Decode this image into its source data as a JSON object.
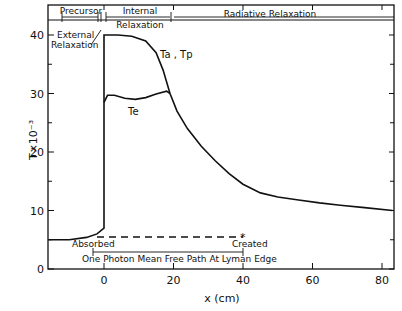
{
  "chart_data": {
    "type": "line",
    "title": "",
    "xlabel": "x (cm)",
    "ylabel": "T×10⁻³",
    "xlim": [
      -16,
      84
    ],
    "ylim": [
      0,
      44
    ],
    "x_ticks": [
      "0",
      "20",
      "40",
      "60",
      "80"
    ],
    "y_ticks": [
      "0",
      "10",
      "20",
      "30",
      "40"
    ],
    "grid": false,
    "series": [
      {
        "name": "Ta, Tp",
        "x": [
          -16,
          -10,
          -5,
          -2,
          0,
          0,
          4,
          8,
          12,
          15,
          17,
          19,
          21,
          24,
          28,
          32,
          36,
          40,
          45,
          50,
          56,
          62,
          68,
          75,
          83
        ],
        "values": [
          5,
          5,
          5.4,
          6,
          7,
          40,
          40,
          39.8,
          39,
          37,
          34,
          30,
          27,
          24,
          21,
          18.5,
          16.3,
          14.5,
          13,
          12.3,
          11.8,
          11.3,
          10.9,
          10.5,
          10
        ]
      },
      {
        "name": "Te",
        "x": [
          0,
          1,
          3,
          6,
          9,
          12,
          15,
          18,
          19
        ],
        "values": [
          28.5,
          29.7,
          29.7,
          29.2,
          29,
          29.3,
          29.9,
          30.4,
          30
        ]
      }
    ],
    "annotations": {
      "regions": [
        {
          "label": "Precursor",
          "x_start": -16,
          "x_end": -1
        },
        {
          "label": "Internal Relaxation",
          "x_start": 0,
          "x_end": 19
        },
        {
          "label": "Radiative Relaxation",
          "x_start": 19,
          "x_end": 84
        }
      ],
      "external_relaxation": "External Relaxation",
      "curve_label_a": "Ta , Tp",
      "curve_label_e": "Te",
      "absorbed": "Absorbed",
      "created": "Created",
      "mean_free_path": "One Photon Mean Free Path At Lyman Edge"
    }
  }
}
